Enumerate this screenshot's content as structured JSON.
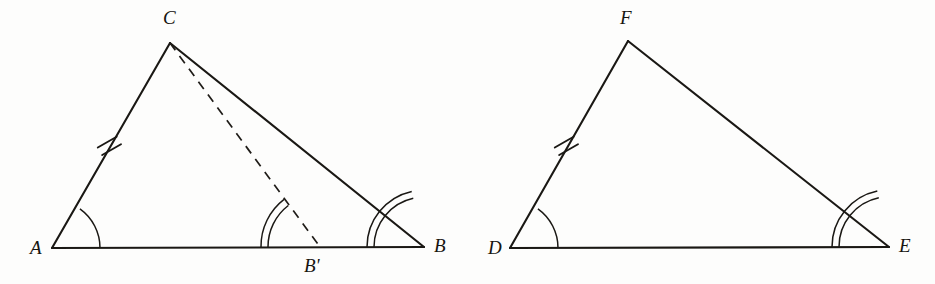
{
  "figure": {
    "background_color": "#fdfdfc",
    "ink_color": "#1a1814",
    "labels": {
      "A": "A",
      "B": "B",
      "B_prime": "B'",
      "C": "C",
      "D": "D",
      "E": "E",
      "F": "F"
    },
    "left_triangle": {
      "name": "triangle-ABC",
      "vertices": {
        "A": {
          "x": 52,
          "y": 248
        },
        "B": {
          "x": 424,
          "y": 247
        },
        "C": {
          "x": 170,
          "y": 43
        }
      },
      "auxiliary_point": {
        "label": "B'",
        "x": 320,
        "y": 247
      },
      "label_positions": {
        "A": {
          "x": 30,
          "y": 254
        },
        "B": {
          "x": 434,
          "y": 252
        },
        "C": {
          "x": 163,
          "y": 24
        },
        "B_prime": {
          "x": 306,
          "y": 272
        }
      },
      "edges": [
        {
          "name": "AC",
          "from": "A",
          "to": "C",
          "style": "solid",
          "ticks": 2
        },
        {
          "name": "AB",
          "from": "A",
          "to": "B",
          "style": "solid",
          "ticks": 0
        },
        {
          "name": "CB",
          "from": "C",
          "to": "B",
          "style": "solid",
          "ticks": 0
        },
        {
          "name": "CB-prime",
          "from": "C",
          "to": "B'",
          "style": "dashed",
          "ticks": 0
        }
      ],
      "angle_marks": [
        {
          "name": "angle-A",
          "vertex": "A",
          "arcs": 1,
          "radius": 48
        },
        {
          "name": "angle-B",
          "vertex": "B",
          "arcs": 2,
          "radius": 50
        },
        {
          "name": "angle-B-prime",
          "vertex": "B'",
          "arcs": 2,
          "radius": 52
        }
      ],
      "tick_mark": {
        "name": "tick-AC",
        "count": 2,
        "x": 109,
        "y": 145
      }
    },
    "right_triangle": {
      "name": "triangle-DEF",
      "vertices": {
        "D": {
          "x": 510,
          "y": 248
        },
        "E": {
          "x": 889,
          "y": 247
        },
        "F": {
          "x": 628,
          "y": 41
        }
      },
      "label_positions": {
        "D": {
          "x": 488,
          "y": 254
        },
        "E": {
          "x": 899,
          "y": 252
        },
        "F": {
          "x": 620,
          "y": 24
        }
      },
      "edges": [
        {
          "name": "DF",
          "from": "D",
          "to": "F",
          "style": "solid",
          "ticks": 2
        },
        {
          "name": "DE",
          "from": "D",
          "to": "E",
          "style": "solid",
          "ticks": 0
        },
        {
          "name": "FE",
          "from": "F",
          "to": "E",
          "style": "solid",
          "ticks": 0
        }
      ],
      "angle_marks": [
        {
          "name": "angle-D",
          "vertex": "D",
          "arcs": 1,
          "radius": 48
        },
        {
          "name": "angle-E",
          "vertex": "E",
          "arcs": 2,
          "radius": 50
        }
      ],
      "tick_mark": {
        "name": "tick-DF",
        "count": 2,
        "x": 566,
        "y": 145
      }
    }
  }
}
